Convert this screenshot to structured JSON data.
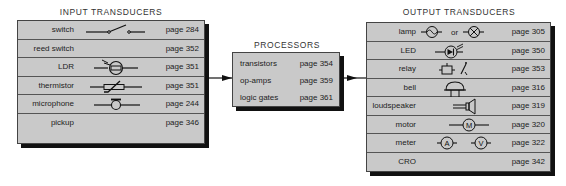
{
  "input": {
    "title": "INPUT TRANSDUCERS",
    "items": [
      {
        "label": "switch",
        "symbol": "switch-symbol",
        "page": "page 284"
      },
      {
        "label": "reed switch",
        "symbol": "",
        "page": "page 352"
      },
      {
        "label": "LDR",
        "symbol": "ldr-symbol",
        "page": "page 351"
      },
      {
        "label": "thermistor",
        "symbol": "thermistor-symbol",
        "page": "page 351"
      },
      {
        "label": "microphone",
        "symbol": "microphone-symbol",
        "page": "page 244"
      },
      {
        "label": "pickup",
        "symbol": "",
        "page": "page 346"
      }
    ]
  },
  "processors": {
    "title": "PROCESSORS",
    "items": [
      {
        "label": "transistors",
        "page": "page 354"
      },
      {
        "label": "op-amps",
        "page": "page 359"
      },
      {
        "label": "logic gates",
        "page": "page 361"
      }
    ]
  },
  "output": {
    "title": "OUTPUT TRANSDUCERS",
    "lamp_or": "or",
    "meter_a": "A",
    "meter_v": "V",
    "motor_m": "M",
    "items": [
      {
        "label": "lamp",
        "symbol": "lamp-symbol",
        "page": "page 305"
      },
      {
        "label": "LED",
        "symbol": "led-symbol",
        "page": "page 350"
      },
      {
        "label": "relay",
        "symbol": "relay-symbol",
        "page": "page 353"
      },
      {
        "label": "bell",
        "symbol": "bell-symbol",
        "page": "page 316"
      },
      {
        "label": "loudspeaker",
        "symbol": "loudspeaker-symbol",
        "page": "page 319"
      },
      {
        "label": "motor",
        "symbol": "motor-symbol",
        "page": "page 320"
      },
      {
        "label": "meter",
        "symbol": "meter-symbol",
        "page": "page 322"
      },
      {
        "label": "CRO",
        "symbol": "",
        "page": "page 342"
      }
    ]
  }
}
